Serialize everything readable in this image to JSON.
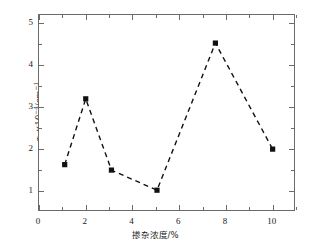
{
  "chart_data": {
    "type": "line",
    "title": "",
    "subtitle": "",
    "xlabel": "掺杂浓度/%",
    "ylabel": "αb×10-4/cm-1",
    "ylabel_parts": {
      "symbol": "α",
      "subscript": "b",
      "times": "×10",
      "exponent": "-4",
      "unit": "/cm",
      "unit_exponent": "-1"
    },
    "xlim": [
      0,
      11
    ],
    "ylim": [
      0.5,
      5.2
    ],
    "grid": false,
    "legend": null,
    "marker": "filled-square",
    "linestyle": "dashed",
    "line_color": "#111111",
    "marker_color": "#111111",
    "x": [
      1.1,
      2.0,
      3.1,
      5.05,
      7.55,
      10.0
    ],
    "values": [
      1.63,
      3.2,
      1.5,
      1.02,
      4.53,
      2.0
    ],
    "points": [
      {
        "x": 1.1,
        "y": 1.63
      },
      {
        "x": 2.0,
        "y": 3.2
      },
      {
        "x": 3.1,
        "y": 1.5
      },
      {
        "x": 5.05,
        "y": 1.02
      },
      {
        "x": 7.55,
        "y": 4.53
      },
      {
        "x": 10.0,
        "y": 2.0
      }
    ],
    "x_ticks": [
      {
        "value": 0,
        "label": "0"
      },
      {
        "value": 1,
        "label": ""
      },
      {
        "value": 2,
        "label": "2"
      },
      {
        "value": 3,
        "label": ""
      },
      {
        "value": 4,
        "label": "4"
      },
      {
        "value": 5,
        "label": ""
      },
      {
        "value": 6,
        "label": "6"
      },
      {
        "value": 7,
        "label": ""
      },
      {
        "value": 8,
        "label": "8"
      },
      {
        "value": 9,
        "label": ""
      },
      {
        "value": 10,
        "label": "10"
      },
      {
        "value": 11,
        "label": ""
      }
    ],
    "y_ticks": [
      {
        "value": 1,
        "label": "1"
      },
      {
        "value": 1.5,
        "label": ""
      },
      {
        "value": 2,
        "label": "2"
      },
      {
        "value": 2.5,
        "label": ""
      },
      {
        "value": 3,
        "label": "3"
      },
      {
        "value": 3.5,
        "label": ""
      },
      {
        "value": 4,
        "label": "4"
      },
      {
        "value": 4.5,
        "label": ""
      },
      {
        "value": 5,
        "label": "5"
      }
    ],
    "axis_color": "#6b6b6b"
  }
}
